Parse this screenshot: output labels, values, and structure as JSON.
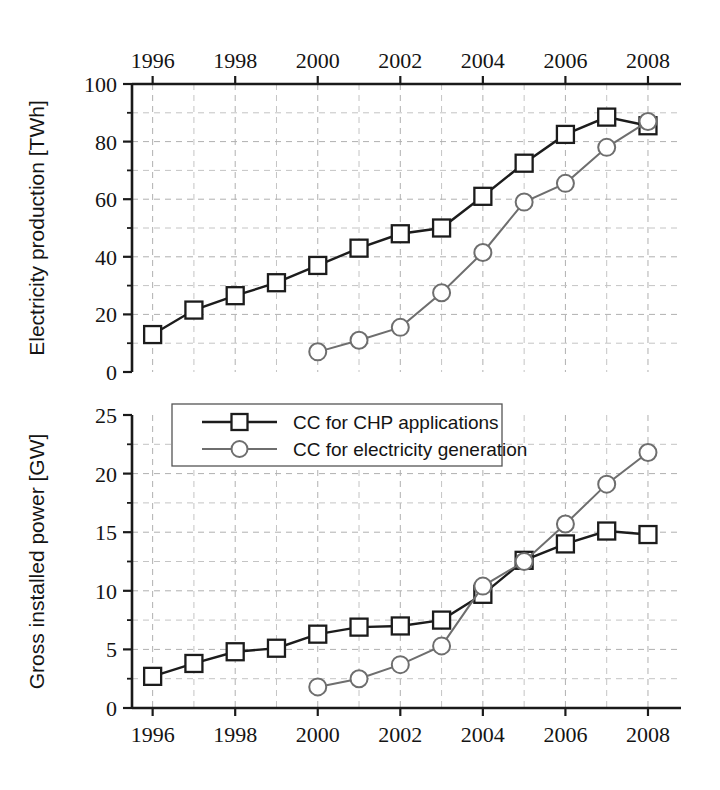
{
  "figure": {
    "background": "#ffffff",
    "series_colors": {
      "chp": "#1c1c1c",
      "elec": "#6e6e6e"
    }
  },
  "legend": {
    "position": "bottom-panel-top-left",
    "items": [
      {
        "label": "CC for CHP applications",
        "marker": "square",
        "color": "#1c1c1c"
      },
      {
        "label": "CC for electricity generation",
        "marker": "circle",
        "color": "#6e6e6e"
      }
    ]
  },
  "chart_data": [
    {
      "type": "line",
      "panel": "top",
      "title": "",
      "xlabel": "",
      "ylabel": "Electricity production [TWh]",
      "x": [
        1996,
        1997,
        1998,
        1999,
        2000,
        2001,
        2002,
        2003,
        2004,
        2005,
        2006,
        2007,
        2008
      ],
      "xlim": [
        1995.5,
        2008.8
      ],
      "ylim": [
        0,
        100
      ],
      "xticks": [
        1996,
        1998,
        2000,
        2002,
        2004,
        2006,
        2008
      ],
      "xticklabels": [
        "1996",
        "1998",
        "2000",
        "2002",
        "2004",
        "2006",
        "2008"
      ],
      "xtick_position": "top",
      "yticks": [
        0,
        20,
        40,
        60,
        80,
        100
      ],
      "yticklabels": [
        "0",
        "20",
        "40",
        "60",
        "80",
        "100"
      ],
      "yminorticks": [
        10,
        30,
        50,
        70,
        90
      ],
      "grid": true,
      "grid_style": "dashed",
      "series": [
        {
          "name": "CC for CHP applications",
          "marker": "square",
          "color": "#1c1c1c",
          "x": [
            1996,
            1997,
            1998,
            1999,
            2000,
            2001,
            2002,
            2003,
            2004,
            2005,
            2006,
            2007,
            2008
          ],
          "values": [
            13,
            21.5,
            26.5,
            31,
            37,
            43,
            48,
            50,
            61,
            72.5,
            82.5,
            88.5,
            85.5
          ]
        },
        {
          "name": "CC for electricity generation",
          "marker": "circle",
          "color": "#6e6e6e",
          "x": [
            2000,
            2001,
            2002,
            2003,
            2004,
            2005,
            2006,
            2007,
            2008
          ],
          "values": [
            7,
            11,
            15.5,
            27.5,
            41.5,
            59,
            65.5,
            78,
            87
          ]
        }
      ]
    },
    {
      "type": "line",
      "panel": "bottom",
      "title": "",
      "xlabel": "",
      "ylabel": "Gross installed power [GW]",
      "x": [
        1996,
        1997,
        1998,
        1999,
        2000,
        2001,
        2002,
        2003,
        2004,
        2005,
        2006,
        2007,
        2008
      ],
      "xlim": [
        1995.5,
        2008.8
      ],
      "ylim": [
        0,
        25
      ],
      "xticks": [
        1996,
        1998,
        2000,
        2002,
        2004,
        2006,
        2008
      ],
      "xticklabels": [
        "1996",
        "1998",
        "2000",
        "2002",
        "2004",
        "2006",
        "2008"
      ],
      "xtick_position": "bottom",
      "yticks": [
        0,
        5,
        10,
        15,
        20,
        25
      ],
      "yticklabels": [
        "0",
        "5",
        "10",
        "15",
        "20",
        "25"
      ],
      "yminorticks": [
        2.5,
        7.5,
        12.5,
        17.5,
        22.5
      ],
      "grid": true,
      "grid_style": "dashed",
      "series": [
        {
          "name": "CC for CHP applications",
          "marker": "square",
          "color": "#1c1c1c",
          "x": [
            1996,
            1997,
            1998,
            1999,
            2000,
            2001,
            2002,
            2003,
            2004,
            2005,
            2006,
            2007,
            2008
          ],
          "values": [
            2.7,
            3.8,
            4.8,
            5.1,
            6.3,
            6.9,
            7.0,
            7.5,
            9.7,
            12.6,
            14.0,
            15.1,
            14.8
          ]
        },
        {
          "name": "CC for electricity generation",
          "marker": "circle",
          "color": "#6e6e6e",
          "x": [
            2000,
            2001,
            2002,
            2003,
            2004,
            2005,
            2006,
            2007,
            2008
          ],
          "values": [
            1.8,
            2.5,
            3.7,
            5.3,
            10.4,
            12.5,
            15.7,
            19.1,
            21.8
          ]
        }
      ]
    }
  ]
}
